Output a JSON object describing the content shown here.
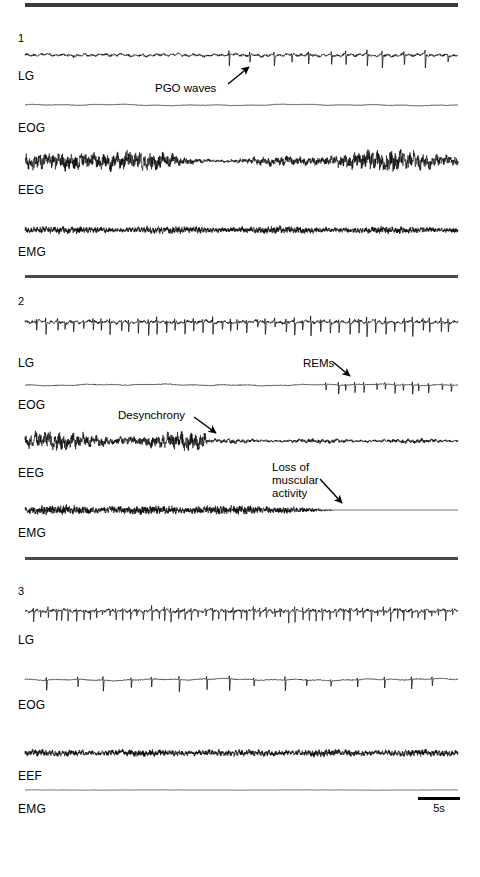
{
  "figure": {
    "background_color": "#ffffff",
    "ink_color": "#000000",
    "rule_color": "#3a3a3a"
  },
  "panels": [
    {
      "number": "1",
      "channels": [
        {
          "label": "LG",
          "kind": "lgn-spiky-sparse"
        },
        {
          "label": "EOG",
          "kind": "eog-flat"
        },
        {
          "label": "EEG",
          "kind": "eeg-dense"
        },
        {
          "label": "EMG",
          "kind": "emg-tonic"
        }
      ],
      "annotations": [
        {
          "text": "PGO waves",
          "target": "LG"
        }
      ]
    },
    {
      "number": "2",
      "channels": [
        {
          "label": "LG",
          "kind": "lgn-spiky-dense"
        },
        {
          "label": "EOG",
          "kind": "eog-rems"
        },
        {
          "label": "EEG",
          "kind": "eeg-desync"
        },
        {
          "label": "EMG",
          "kind": "emg-atonia"
        }
      ],
      "annotations": [
        {
          "text": "REMs",
          "target": "EOG"
        },
        {
          "text": "Desynchrony",
          "target": "EEG"
        },
        {
          "text": "Loss of\nmuscular\nactivity",
          "target": "EMG"
        }
      ]
    },
    {
      "number": "3",
      "channels": [
        {
          "label": "LG",
          "kind": "lgn-very-dense"
        },
        {
          "label": "EOG",
          "kind": "eog-saccades"
        },
        {
          "label": "EEF",
          "kind": "eeg-low"
        },
        {
          "label": "EMG",
          "kind": "emg-silent"
        }
      ],
      "annotations": []
    }
  ],
  "scale_bar": {
    "label": "5s",
    "seconds": 5
  },
  "chart_data": {
    "type": "line",
    "xlabel": "",
    "ylabel": "",
    "grid": false,
    "legend_position": "none",
    "x_scale_bar": {
      "label": "5s",
      "value": 5,
      "units": "seconds"
    },
    "panels": [
      {
        "name": "1",
        "description": "Transition / pre-REM: PGO waves emerging in LG, flat EOG, synchronized EEG, tonic EMG",
        "series": [
          {
            "name": "LG",
            "channel_label": "LG",
            "baseline_noise": 0.1,
            "spike_count": 12,
            "spike_polarity": "biphasic",
            "spike_amplitude": 0.85,
            "spike_region": "right-half",
            "annotation": "PGO waves"
          },
          {
            "name": "EOG",
            "channel_label": "EOG",
            "baseline_noise": 0.02,
            "spike_count": 0,
            "spike_polarity": "none",
            "spike_amplitude": 0.0,
            "spike_region": "none",
            "annotation": ""
          },
          {
            "name": "EEG",
            "channel_label": "EEG",
            "baseline_noise": 0.55,
            "spike_count": 0,
            "spike_polarity": "none",
            "spike_amplitude": 0.0,
            "spike_region": "full",
            "annotation": ""
          },
          {
            "name": "EMG",
            "channel_label": "EMG",
            "baseline_noise": 0.22,
            "spike_count": 0,
            "spike_polarity": "none",
            "spike_amplitude": 0.0,
            "spike_region": "full",
            "annotation": ""
          }
        ]
      },
      {
        "name": "2",
        "description": "REM onset: dense PGO spiking in LG, rapid eye movements late in EOG, EEG desynchronizes mid-trace, EMG atonia develops",
        "series": [
          {
            "name": "LG",
            "channel_label": "LG",
            "baseline_noise": 0.14,
            "spike_count": 46,
            "spike_polarity": "biphasic",
            "spike_amplitude": 0.95,
            "spike_region": "full",
            "annotation": ""
          },
          {
            "name": "EOG",
            "channel_label": "EOG",
            "baseline_noise": 0.04,
            "spike_count": 14,
            "spike_polarity": "biphasic",
            "spike_amplitude": 0.9,
            "spike_region": "right-third",
            "annotation": "REMs"
          },
          {
            "name": "EEG",
            "channel_label": "EEG",
            "baseline_noise": 0.6,
            "spike_count": 0,
            "spike_polarity": "none",
            "spike_amplitude": 0.0,
            "spike_region": "left-half",
            "annotation": "Desynchrony"
          },
          {
            "name": "EMG",
            "channel_label": "EMG",
            "baseline_noise": 0.3,
            "spike_count": 0,
            "spike_polarity": "none",
            "spike_amplitude": 0.0,
            "spike_region": "left-two-thirds",
            "annotation": "Loss of muscular activity"
          }
        ]
      },
      {
        "name": "3",
        "description": "Established REM: continuous LG spiking, phasic EOG saccades, low-voltage fast EEF, silent EMG",
        "series": [
          {
            "name": "LG",
            "channel_label": "LG",
            "baseline_noise": 0.16,
            "spike_count": 62,
            "spike_polarity": "biphasic",
            "spike_amplitude": 0.9,
            "spike_region": "full",
            "annotation": ""
          },
          {
            "name": "EOG",
            "channel_label": "EOG",
            "baseline_noise": 0.06,
            "spike_count": 16,
            "spike_polarity": "biphasic",
            "spike_amplitude": 1.0,
            "spike_region": "full",
            "annotation": ""
          },
          {
            "name": "EEF",
            "channel_label": "EEF",
            "baseline_noise": 0.25,
            "spike_count": 0,
            "spike_polarity": "none",
            "spike_amplitude": 0.0,
            "spike_region": "full",
            "annotation": ""
          },
          {
            "name": "EMG",
            "channel_label": "EMG",
            "baseline_noise": 0.015,
            "spike_count": 0,
            "spike_polarity": "none",
            "spike_amplitude": 0.0,
            "spike_region": "full",
            "annotation": ""
          }
        ]
      }
    ]
  }
}
